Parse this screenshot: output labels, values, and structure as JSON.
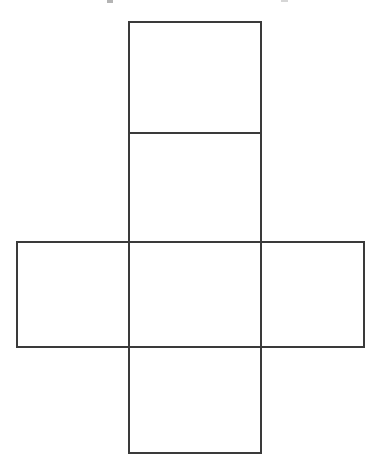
{
  "figure": {
    "background_color": "#ffffff",
    "stroke_color": "#3a3a3a",
    "stroke_width": 1.5,
    "width": 382,
    "height": 469,
    "caption_remnant_note": "faint cropped ink marks along the very top edge"
  },
  "chart_data": {
    "type": "diagram",
    "xlabel": "",
    "ylabel": "",
    "grid": false,
    "legend_position": "none",
    "xlim": [
      0,
      382
    ],
    "ylim": [
      0,
      469
    ],
    "faces": [
      {
        "name": "top-face",
        "label": "",
        "x": 129,
        "y": 22,
        "width": 132,
        "height": 111
      },
      {
        "name": "upper-middle-face",
        "label": "",
        "x": 129,
        "y": 133,
        "width": 132,
        "height": 109
      },
      {
        "name": "center-face",
        "label": "",
        "x": 129,
        "y": 242,
        "width": 132,
        "height": 105
      },
      {
        "name": "left-face",
        "label": "",
        "x": 17,
        "y": 242,
        "width": 112,
        "height": 105
      },
      {
        "name": "right-face",
        "label": "",
        "x": 261,
        "y": 242,
        "width": 103,
        "height": 105
      },
      {
        "name": "bottom-face",
        "label": "",
        "x": 129,
        "y": 347,
        "width": 132,
        "height": 106
      }
    ],
    "edges": [
      {
        "name": "outer-top",
        "x1": 129,
        "y1": 22,
        "x2": 261,
        "y2": 22
      },
      {
        "name": "center-column-left",
        "x1": 129,
        "y1": 22,
        "x2": 129,
        "y2": 453
      },
      {
        "name": "center-column-right",
        "x1": 261,
        "y1": 22,
        "x2": 261,
        "y2": 453
      },
      {
        "name": "outer-bottom",
        "x1": 129,
        "y1": 453,
        "x2": 261,
        "y2": 453
      },
      {
        "name": "fold-top-upper",
        "x1": 129,
        "y1": 133,
        "x2": 261,
        "y2": 133
      },
      {
        "name": "band-top",
        "x1": 17,
        "y1": 242,
        "x2": 364,
        "y2": 242
      },
      {
        "name": "band-bottom",
        "x1": 17,
        "y1": 347,
        "x2": 364,
        "y2": 347
      },
      {
        "name": "left-face-outer-edge",
        "x1": 17,
        "y1": 242,
        "x2": 17,
        "y2": 347
      },
      {
        "name": "right-face-outer-edge",
        "x1": 364,
        "y1": 242,
        "x2": 364,
        "y2": 347
      }
    ]
  }
}
